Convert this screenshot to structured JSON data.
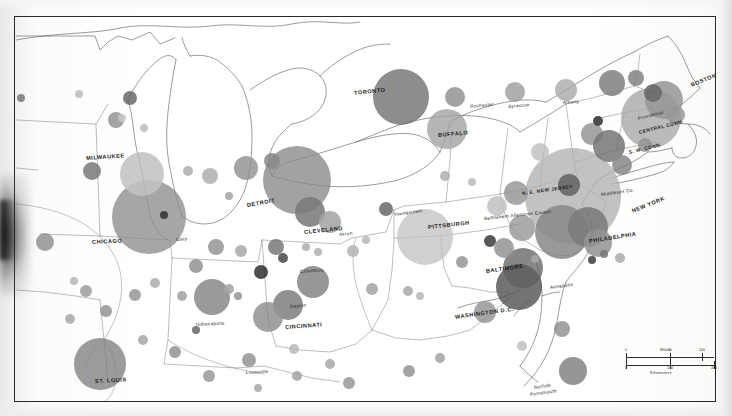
{
  "document": {
    "type": "scanned-thematic-map",
    "subject": "Northeastern United States metropolitan population circles",
    "background_color": "#ffffff",
    "frame_color": "#2a2a2a"
  },
  "scale_bar": {
    "miles_label": "Miles",
    "kilometers_label": "Kilometers",
    "miles_ticks": [
      "0",
      "50",
      "100"
    ],
    "kilometers_ticks": [
      "0",
      "100",
      "200"
    ]
  },
  "labels": {
    "major": [
      {
        "text": "MILWAUKEE",
        "x": 86,
        "y": 155,
        "rot": -4
      },
      {
        "text": "CHICAGO",
        "x": 92,
        "y": 239,
        "rot": -3
      },
      {
        "text": "DETROIT",
        "x": 247,
        "y": 202,
        "rot": -10
      },
      {
        "text": "TORONTO",
        "x": 354,
        "y": 90,
        "rot": -6
      },
      {
        "text": "BUFFALO",
        "x": 438,
        "y": 132,
        "rot": -5
      },
      {
        "text": "CLEVELAND",
        "x": 304,
        "y": 229,
        "rot": -6
      },
      {
        "text": "PITTSBURGH",
        "x": 428,
        "y": 224,
        "rot": -6
      },
      {
        "text": "CINCINNATI",
        "x": 285,
        "y": 324,
        "rot": -4
      },
      {
        "text": "BALTIMORE",
        "x": 486,
        "y": 268,
        "rot": -8
      },
      {
        "text": "WASHINGTON D.C.",
        "x": 455,
        "y": 314,
        "rot": -8
      },
      {
        "text": "PHILADELPHIA",
        "x": 589,
        "y": 238,
        "rot": -9
      },
      {
        "text": "NEW YORK",
        "x": 632,
        "y": 208,
        "rot": -22
      },
      {
        "text": "BOSTON",
        "x": 691,
        "y": 82,
        "rot": -22
      },
      {
        "text": "ST. LOUIS",
        "x": 95,
        "y": 378,
        "rot": -3
      }
    ],
    "minor": [
      {
        "text": "Gary",
        "x": 176,
        "y": 237,
        "rot": -5
      },
      {
        "text": "Akron",
        "x": 339,
        "y": 232,
        "rot": -6
      },
      {
        "text": "Youngstown",
        "x": 394,
        "y": 212,
        "rot": -8
      },
      {
        "text": "Columbus",
        "x": 300,
        "y": 269,
        "rot": -4
      },
      {
        "text": "Dayton",
        "x": 290,
        "y": 304,
        "rot": -5
      },
      {
        "text": "Indianapolis",
        "x": 196,
        "y": 322,
        "rot": -3
      },
      {
        "text": "Louisville",
        "x": 246,
        "y": 370,
        "rot": -3
      },
      {
        "text": "Rochester",
        "x": 470,
        "y": 104,
        "rot": -6
      },
      {
        "text": "Syracuse",
        "x": 508,
        "y": 104,
        "rot": -5
      },
      {
        "text": "Albany",
        "x": 563,
        "y": 100,
        "rot": -4
      },
      {
        "text": "Providence",
        "x": 638,
        "y": 116,
        "rot": -14
      },
      {
        "text": "Annapolis",
        "x": 550,
        "y": 285,
        "rot": -8
      },
      {
        "text": "Bethlehem Allentown Easton",
        "x": 484,
        "y": 216,
        "rot": -6
      },
      {
        "text": "Middlesex Co.",
        "x": 601,
        "y": 192,
        "rot": -8
      },
      {
        "text": "Norfolk",
        "x": 534,
        "y": 385,
        "rot": -8
      },
      {
        "text": "Portsmouth",
        "x": 530,
        "y": 392,
        "rot": -8
      }
    ],
    "region": [
      {
        "text": "N. E. NEW JERSEY",
        "x": 522,
        "y": 191,
        "rot": -8
      },
      {
        "text": "CENTRAL CONN.",
        "x": 639,
        "y": 130,
        "rot": -14
      },
      {
        "text": "S. W. CONN.",
        "x": 629,
        "y": 150,
        "rot": -14
      }
    ]
  },
  "circles": [
    {
      "cx": 149,
      "cy": 217,
      "r": 37,
      "tone": "#8e8e8e"
    },
    {
      "cx": 142,
      "cy": 174,
      "r": 22,
      "tone": "#bcbcbc"
    },
    {
      "cx": 297,
      "cy": 180,
      "r": 34,
      "tone": "#8a8a8a"
    },
    {
      "cx": 401,
      "cy": 97,
      "r": 28,
      "tone": "#6e6e6e"
    },
    {
      "cx": 447,
      "cy": 129,
      "r": 20,
      "tone": "#a2a2a2"
    },
    {
      "cx": 425,
      "cy": 237,
      "r": 28,
      "tone": "#c3c3c3"
    },
    {
      "cx": 573,
      "cy": 196,
      "r": 48,
      "tone": "#b2b2b2"
    },
    {
      "cx": 562,
      "cy": 232,
      "r": 27,
      "tone": "#7d7d7d"
    },
    {
      "cx": 651,
      "cy": 118,
      "r": 30,
      "tone": "#a9a9a9"
    },
    {
      "cx": 664,
      "cy": 100,
      "r": 19,
      "tone": "#8d8d8d"
    },
    {
      "cx": 523,
      "cy": 268,
      "r": 20,
      "tone": "#666666"
    },
    {
      "cx": 519,
      "cy": 287,
      "r": 23,
      "tone": "#4f4f4f"
    },
    {
      "cx": 100,
      "cy": 364,
      "r": 26,
      "tone": "#818181"
    },
    {
      "cx": 212,
      "cy": 297,
      "r": 18,
      "tone": "#7f7f7f"
    },
    {
      "cx": 313,
      "cy": 282,
      "r": 16,
      "tone": "#7b7b7b"
    },
    {
      "cx": 288,
      "cy": 305,
      "r": 15,
      "tone": "#747474"
    },
    {
      "cx": 310,
      "cy": 212,
      "r": 15,
      "tone": "#6c6c6c"
    },
    {
      "cx": 330,
      "cy": 222,
      "r": 11,
      "tone": "#9b9b9b"
    },
    {
      "cx": 268,
      "cy": 317,
      "r": 15,
      "tone": "#8a8a8a"
    },
    {
      "cx": 588,
      "cy": 227,
      "r": 20,
      "tone": "#6e6e6e"
    },
    {
      "cx": 598,
      "cy": 243,
      "r": 14,
      "tone": "#8a8a8a"
    },
    {
      "cx": 569,
      "cy": 185,
      "r": 11,
      "tone": "#555555"
    },
    {
      "cx": 573,
      "cy": 371,
      "r": 14,
      "tone": "#7a7a7a"
    },
    {
      "cx": 485,
      "cy": 312,
      "r": 11,
      "tone": "#8f8f8f"
    },
    {
      "cx": 455,
      "cy": 97,
      "r": 10,
      "tone": "#8b8b8b"
    },
    {
      "cx": 515,
      "cy": 92,
      "r": 10,
      "tone": "#9a9a9a"
    },
    {
      "cx": 566,
      "cy": 90,
      "r": 11,
      "tone": "#a7a7a7"
    },
    {
      "cx": 612,
      "cy": 83,
      "r": 13,
      "tone": "#757575"
    },
    {
      "cx": 130,
      "cy": 98,
      "r": 7,
      "tone": "#5d5d5d"
    },
    {
      "cx": 116,
      "cy": 120,
      "r": 8,
      "tone": "#8b8b8b"
    },
    {
      "cx": 92,
      "cy": 171,
      "r": 9,
      "tone": "#6f6f6f"
    },
    {
      "cx": 45,
      "cy": 242,
      "r": 9,
      "tone": "#8a8a8a"
    },
    {
      "cx": 210,
      "cy": 176,
      "r": 8,
      "tone": "#a9a9a9"
    },
    {
      "cx": 246,
      "cy": 168,
      "r": 12,
      "tone": "#8d8d8d"
    },
    {
      "cx": 272,
      "cy": 161,
      "r": 8,
      "tone": "#7d7d7d"
    },
    {
      "cx": 216,
      "cy": 247,
      "r": 8,
      "tone": "#8c8c8c"
    },
    {
      "cx": 241,
      "cy": 251,
      "r": 6,
      "tone": "#a0a0a0"
    },
    {
      "cx": 196,
      "cy": 266,
      "r": 7,
      "tone": "#8a8a8a"
    },
    {
      "cx": 276,
      "cy": 247,
      "r": 8,
      "tone": "#6d6d6d"
    },
    {
      "cx": 353,
      "cy": 251,
      "r": 6,
      "tone": "#aeaeae"
    },
    {
      "cx": 386,
      "cy": 209,
      "r": 7,
      "tone": "#5c5c5c"
    },
    {
      "cx": 372,
      "cy": 289,
      "r": 6,
      "tone": "#9d9d9d"
    },
    {
      "cx": 408,
      "cy": 291,
      "r": 5,
      "tone": "#a4a4a4"
    },
    {
      "cx": 420,
      "cy": 296,
      "r": 4,
      "tone": "#b2b2b2"
    },
    {
      "cx": 462,
      "cy": 262,
      "r": 6,
      "tone": "#8d8d8d"
    },
    {
      "cx": 490,
      "cy": 241,
      "r": 6,
      "tone": "#2b2b2b"
    },
    {
      "cx": 497,
      "cy": 206,
      "r": 10,
      "tone": "#bcbcbc"
    },
    {
      "cx": 516,
      "cy": 193,
      "r": 12,
      "tone": "#8f8f8f"
    },
    {
      "cx": 522,
      "cy": 228,
      "r": 13,
      "tone": "#949494"
    },
    {
      "cx": 504,
      "cy": 248,
      "r": 10,
      "tone": "#8c8c8c"
    },
    {
      "cx": 540,
      "cy": 152,
      "r": 9,
      "tone": "#bdbdbd"
    },
    {
      "cx": 592,
      "cy": 134,
      "r": 11,
      "tone": "#8e8e8e"
    },
    {
      "cx": 598,
      "cy": 121,
      "r": 5,
      "tone": "#1e1e1e"
    },
    {
      "cx": 609,
      "cy": 146,
      "r": 16,
      "tone": "#6b6b6b"
    },
    {
      "cx": 622,
      "cy": 165,
      "r": 10,
      "tone": "#7e7e7e"
    },
    {
      "cx": 645,
      "cy": 145,
      "r": 7,
      "tone": "#8c8c8c"
    },
    {
      "cx": 676,
      "cy": 115,
      "r": 9,
      "tone": "#909090"
    },
    {
      "cx": 653,
      "cy": 93,
      "r": 9,
      "tone": "#5a5a5a"
    },
    {
      "cx": 636,
      "cy": 78,
      "r": 8,
      "tone": "#7a7a7a"
    },
    {
      "cx": 106,
      "cy": 311,
      "r": 6,
      "tone": "#8c8c8c"
    },
    {
      "cx": 70,
      "cy": 319,
      "r": 5,
      "tone": "#a0a0a0"
    },
    {
      "cx": 86,
      "cy": 291,
      "r": 6,
      "tone": "#959595"
    },
    {
      "cx": 135,
      "cy": 295,
      "r": 6,
      "tone": "#8e8e8e"
    },
    {
      "cx": 155,
      "cy": 283,
      "r": 5,
      "tone": "#a6a6a6"
    },
    {
      "cx": 74,
      "cy": 281,
      "r": 4,
      "tone": "#b0b0b0"
    },
    {
      "cx": 182,
      "cy": 296,
      "r": 5,
      "tone": "#9a9a9a"
    },
    {
      "cx": 143,
      "cy": 340,
      "r": 5,
      "tone": "#9e9e9e"
    },
    {
      "cx": 175,
      "cy": 352,
      "r": 6,
      "tone": "#8a8a8a"
    },
    {
      "cx": 229,
      "cy": 289,
      "r": 5,
      "tone": "#9a9a9a"
    },
    {
      "cx": 238,
      "cy": 296,
      "r": 4,
      "tone": "#8d8d8d"
    },
    {
      "cx": 196,
      "cy": 330,
      "r": 4,
      "tone": "#5c5c5c"
    },
    {
      "cx": 249,
      "cy": 360,
      "r": 7,
      "tone": "#8c8c8c"
    },
    {
      "cx": 209,
      "cy": 376,
      "r": 6,
      "tone": "#8f8f8f"
    },
    {
      "cx": 258,
      "cy": 388,
      "r": 4,
      "tone": "#a0a0a0"
    },
    {
      "cx": 297,
      "cy": 376,
      "r": 5,
      "tone": "#9c9c9c"
    },
    {
      "cx": 330,
      "cy": 364,
      "r": 5,
      "tone": "#a2a2a2"
    },
    {
      "cx": 349,
      "cy": 383,
      "r": 6,
      "tone": "#8e8e8e"
    },
    {
      "cx": 409,
      "cy": 371,
      "r": 6,
      "tone": "#8c8c8c"
    },
    {
      "cx": 440,
      "cy": 358,
      "r": 5,
      "tone": "#9b9b9b"
    },
    {
      "cx": 294,
      "cy": 349,
      "r": 5,
      "tone": "#b3b3b3"
    },
    {
      "cx": 261,
      "cy": 272,
      "r": 7,
      "tone": "#1f1f1f"
    },
    {
      "cx": 283,
      "cy": 258,
      "r": 5,
      "tone": "#3a3a3a"
    },
    {
      "cx": 306,
      "cy": 247,
      "r": 4,
      "tone": "#a8a8a8"
    },
    {
      "cx": 164,
      "cy": 215,
      "r": 4,
      "tone": "#202020"
    },
    {
      "cx": 122,
      "cy": 118,
      "r": 4,
      "tone": "#c1c1c1"
    },
    {
      "cx": 21,
      "cy": 98,
      "r": 4,
      "tone": "#6f6f6f"
    },
    {
      "cx": 79,
      "cy": 94,
      "r": 4,
      "tone": "#b6b6b6"
    },
    {
      "cx": 144,
      "cy": 128,
      "r": 4,
      "tone": "#b9b9b9"
    },
    {
      "cx": 188,
      "cy": 171,
      "r": 5,
      "tone": "#a6a6a6"
    },
    {
      "cx": 229,
      "cy": 196,
      "r": 4,
      "tone": "#9c9c9c"
    },
    {
      "cx": 318,
      "cy": 252,
      "r": 4,
      "tone": "#a9a9a9"
    },
    {
      "cx": 366,
      "cy": 240,
      "r": 4,
      "tone": "#b2b2b2"
    },
    {
      "cx": 472,
      "cy": 182,
      "r": 4,
      "tone": "#b4b4b4"
    },
    {
      "cx": 445,
      "cy": 176,
      "r": 5,
      "tone": "#a8a8a8"
    },
    {
      "cx": 535,
      "cy": 259,
      "r": 4,
      "tone": "#9e9e9e"
    },
    {
      "cx": 562,
      "cy": 329,
      "r": 8,
      "tone": "#8c8c8c"
    },
    {
      "cx": 522,
      "cy": 346,
      "r": 5,
      "tone": "#bbbbbb"
    },
    {
      "cx": 620,
      "cy": 258,
      "r": 5,
      "tone": "#a5a5a5"
    },
    {
      "cx": 604,
      "cy": 254,
      "r": 4,
      "tone": "#6a6a6a"
    },
    {
      "cx": 592,
      "cy": 260,
      "r": 4,
      "tone": "#2f2f2f"
    }
  ]
}
